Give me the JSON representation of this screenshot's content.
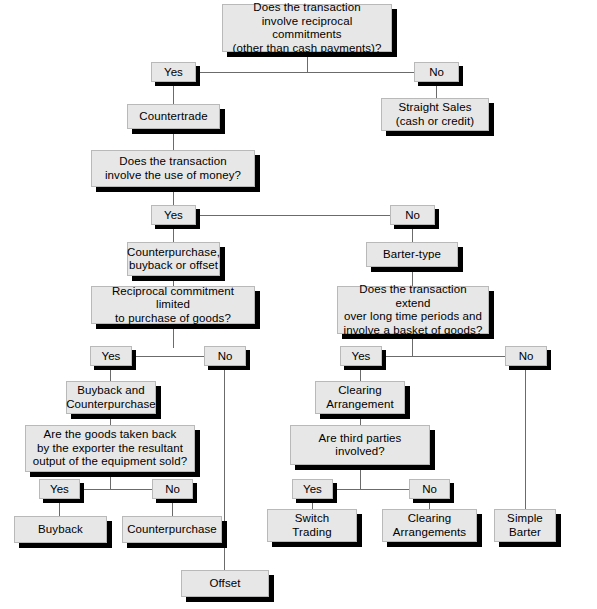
{
  "diagram": {
    "colors": {
      "box_fill": "#e7e7e7",
      "box_border": "#b9b9b9",
      "shadow": "#000000",
      "connector": "#6b6b6b",
      "background": "#ffffff",
      "text": "#000000"
    },
    "nodes": {
      "q_reciprocal": "Does the transaction\ninvolve reciprocal commitments\n(other than cash payments)?",
      "countertrade": "Countertrade",
      "straight_sales": "Straight Sales\n(cash or credit)",
      "q_money": "Does the transaction\ninvolve the use of money?",
      "counterpurchase_buyback_offset": "Counterpurchase,\nbuyback or offset",
      "barter_type": "Barter-type",
      "q_reciprocal_limited": "Reciprocal commitment limited\nto purchase of goods?",
      "q_long_time": "Does the transaction extend\nover long time periods and\ninvolve a basket of goods?",
      "buyback_and_counterpurchase": "Buyback and\nCounterpurchase",
      "clearing_arrangement": "Clearing\nArrangement",
      "q_goods_taken_back": "Are the goods taken back\nby the exporter the resultant\noutput of the equipment sold?",
      "q_third_parties": "Are third parties\ninvolved?",
      "buyback": "Buyback",
      "counterpurchase": "Counterpurchase",
      "switch_trading": "Switch\nTrading",
      "clearing_arrangements": "Clearing\nArrangements",
      "simple_barter": "Simple\nBarter",
      "offset": "Offset"
    },
    "branches": {
      "yes_1": "Yes",
      "no_1": "No",
      "yes_2": "Yes",
      "no_2": "No",
      "yes_3": "Yes",
      "no_3": "No",
      "yes_4": "Yes",
      "no_4": "No",
      "yes_5": "Yes",
      "no_5": "No",
      "yes_6": "Yes",
      "no_6": "No"
    }
  }
}
